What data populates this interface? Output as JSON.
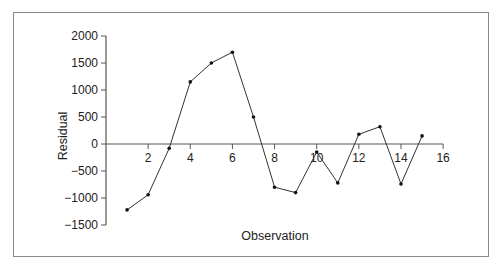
{
  "chart_data": {
    "type": "line",
    "title": "",
    "xlabel": "Observation",
    "ylabel": "Residual",
    "xlim": [
      0,
      16
    ],
    "ylim": [
      -1500,
      2000
    ],
    "x_ticks": [
      2,
      4,
      6,
      8,
      10,
      12,
      14,
      16
    ],
    "y_ticks": [
      2000,
      1500,
      1000,
      500,
      0,
      -500,
      -1000,
      -1500
    ],
    "grid": false,
    "legend": null,
    "series": [
      {
        "name": "Residual",
        "x": [
          1,
          2,
          3,
          4,
          5,
          6,
          7,
          8,
          9,
          10,
          11,
          12,
          13,
          14,
          15
        ],
        "values": [
          -1220,
          -940,
          -80,
          1150,
          1500,
          1700,
          500,
          -800,
          -900,
          -150,
          -720,
          180,
          320,
          -740,
          150
        ]
      }
    ],
    "colors": {
      "line": "#333333",
      "axis": "#555555",
      "frame": "#8a8a8a"
    }
  }
}
